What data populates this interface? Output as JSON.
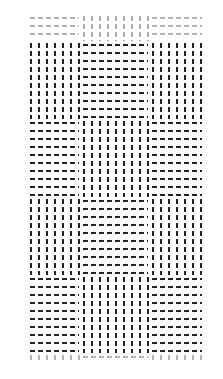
{
  "figure": {
    "background": "#ffffff",
    "element_color": "#222222",
    "columns": [
      {
        "x": 27,
        "w": 53
      },
      {
        "x": 80,
        "w": 69
      },
      {
        "x": 149,
        "w": 54
      }
    ],
    "rows": [
      {
        "y": 14,
        "h": 27,
        "partial": true
      },
      {
        "y": 41,
        "h": 78
      },
      {
        "y": 119,
        "h": 78
      },
      {
        "y": 197,
        "h": 78
      },
      {
        "y": 275,
        "h": 78
      },
      {
        "y": 353,
        "h": 9,
        "partial": true
      }
    ],
    "pattern": [
      [
        "h",
        "v",
        "h"
      ],
      [
        "v",
        "h",
        "v"
      ],
      [
        "h",
        "v",
        "h"
      ],
      [
        "v",
        "h",
        "v"
      ],
      [
        "h",
        "v",
        "h"
      ],
      [
        "v",
        "h",
        "v"
      ]
    ],
    "element_spacing_px": 8,
    "line_spacing_px": 8
  }
}
